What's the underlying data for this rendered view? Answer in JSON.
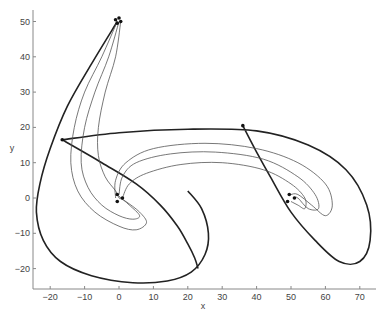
{
  "chart_data": {
    "type": "line",
    "title": "",
    "xlabel": "x",
    "ylabel": "y",
    "xlim": [
      -25,
      75
    ],
    "ylim": [
      -26,
      53
    ],
    "grid": false,
    "legend": null,
    "x_ticks": [
      -20,
      -10,
      0,
      10,
      20,
      30,
      40,
      50,
      60,
      70
    ],
    "y_ticks": [
      -20,
      -10,
      0,
      10,
      20,
      30,
      40,
      50
    ],
    "markers": [
      {
        "x": -1,
        "y": 50.5
      },
      {
        "x": 0,
        "y": 51
      },
      {
        "x": 0.5,
        "y": 50
      },
      {
        "x": -0.5,
        "y": 49.5
      },
      {
        "x": -16.5,
        "y": 16.5
      },
      {
        "x": 36,
        "y": 20.5
      },
      {
        "x": -0.5,
        "y": 1
      },
      {
        "x": 1,
        "y": 0
      },
      {
        "x": -0.5,
        "y": -1
      },
      {
        "x": 49.5,
        "y": 1
      },
      {
        "x": 51,
        "y": 0
      },
      {
        "x": 49,
        "y": -1
      }
    ],
    "series": [
      {
        "name": "thick trajectory (outer loop from top)",
        "style": "thick",
        "points": [
          [
            -0.5,
            50
          ],
          [
            -8,
            38
          ],
          [
            -15,
            26
          ],
          [
            -20,
            14
          ],
          [
            -23,
            4
          ],
          [
            -24,
            -4
          ],
          [
            -22,
            -12
          ],
          [
            -17,
            -18
          ],
          [
            -8,
            -22
          ],
          [
            4,
            -24
          ],
          [
            14,
            -23.5
          ],
          [
            21,
            -21
          ],
          [
            25,
            -16
          ],
          [
            26,
            -10
          ],
          [
            24,
            -3
          ],
          [
            20,
            2
          ]
        ]
      },
      {
        "name": "thick trajectory (diagonal from left point)",
        "style": "thick",
        "points": [
          [
            -16.5,
            16.5
          ],
          [
            -5,
            10
          ],
          [
            5,
            4
          ],
          [
            12,
            -2
          ],
          [
            17,
            -8
          ],
          [
            20,
            -13
          ],
          [
            22,
            -17
          ],
          [
            23,
            -20
          ]
        ]
      },
      {
        "name": "thick trajectory (right loop)",
        "style": "thick",
        "points": [
          [
            -16.5,
            16.5
          ],
          [
            0,
            18.5
          ],
          [
            20,
            19.5
          ],
          [
            40,
            19
          ],
          [
            55,
            15
          ],
          [
            66,
            8
          ],
          [
            72,
            -2
          ],
          [
            73,
            -12
          ],
          [
            70,
            -18
          ],
          [
            64,
            -18
          ],
          [
            57,
            -12
          ],
          [
            50,
            -4
          ],
          [
            44,
            6
          ],
          [
            40,
            13
          ],
          [
            36,
            20.5
          ]
        ]
      },
      {
        "name": "thin trajectory 1",
        "style": "thin",
        "points": [
          [
            -0.5,
            50
          ],
          [
            -5,
            40
          ],
          [
            -10,
            30
          ],
          [
            -13,
            20
          ],
          [
            -14,
            10
          ],
          [
            -12,
            2
          ],
          [
            -7,
            -4
          ],
          [
            0,
            -8
          ],
          [
            5,
            -9
          ],
          [
            8,
            -7
          ],
          [
            6,
            -4
          ],
          [
            2,
            -1
          ],
          [
            0,
            0
          ]
        ]
      },
      {
        "name": "thin trajectory 2",
        "style": "thin",
        "points": [
          [
            0,
            50
          ],
          [
            -3,
            40
          ],
          [
            -7,
            30
          ],
          [
            -10,
            20
          ],
          [
            -11,
            10
          ],
          [
            -9,
            3
          ],
          [
            -5,
            -2
          ],
          [
            0,
            -5
          ],
          [
            4,
            -6
          ],
          [
            6,
            -5
          ],
          [
            3,
            -2
          ],
          [
            0,
            0.5
          ]
        ]
      },
      {
        "name": "thin trajectory 3",
        "style": "thin",
        "points": [
          [
            0.5,
            50
          ],
          [
            -1,
            40
          ],
          [
            -4,
            30
          ],
          [
            -6,
            20
          ],
          [
            -6,
            12
          ],
          [
            -4,
            6
          ],
          [
            -1,
            2
          ],
          [
            0,
            0
          ]
        ]
      },
      {
        "name": "thin spiral right 1",
        "style": "thin",
        "points": [
          [
            -1,
            0
          ],
          [
            -1,
            5
          ],
          [
            2,
            10
          ],
          [
            10,
            14
          ],
          [
            25,
            15.5
          ],
          [
            40,
            14
          ],
          [
            52,
            10
          ],
          [
            60,
            4
          ],
          [
            62,
            -2
          ],
          [
            60,
            -5
          ],
          [
            56,
            -2
          ],
          [
            52,
            1
          ],
          [
            50,
            1
          ]
        ]
      },
      {
        "name": "thin spiral right 2",
        "style": "thin",
        "points": [
          [
            0,
            1
          ],
          [
            1,
            6
          ],
          [
            5,
            10
          ],
          [
            15,
            12.5
          ],
          [
            28,
            13
          ],
          [
            42,
            11
          ],
          [
            52,
            6
          ],
          [
            57,
            1
          ],
          [
            58,
            -3
          ],
          [
            55,
            -3
          ],
          [
            52,
            0
          ],
          [
            51,
            0
          ]
        ]
      },
      {
        "name": "thin spiral right 3",
        "style": "thin",
        "points": [
          [
            1,
            0
          ],
          [
            3,
            4
          ],
          [
            8,
            7
          ],
          [
            18,
            9.5
          ],
          [
            30,
            10
          ],
          [
            42,
            8
          ],
          [
            50,
            4
          ],
          [
            54,
            0
          ],
          [
            54,
            -3
          ],
          [
            52,
            -2
          ],
          [
            50,
            -1
          ]
        ]
      }
    ]
  }
}
